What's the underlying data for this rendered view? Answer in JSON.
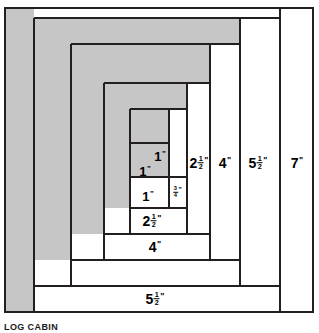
{
  "figure": {
    "caption": "LOG CABIN",
    "colors": {
      "fabric_dark": "#c6c6c6",
      "fabric_light": "#ffffff",
      "line": "#231f20",
      "background": "#ffffff"
    }
  },
  "strips": [
    {
      "id": "center-square",
      "label_whole": "1",
      "label_frac_num": "",
      "label_frac_den": "",
      "unit": "\"",
      "fabric": "dark",
      "x": 130,
      "y": 143,
      "w": 39,
      "h": 34,
      "label_x": 158,
      "label_y": 156,
      "size": "sz-md"
    },
    {
      "id": "log-1-left",
      "label_whole": "1",
      "label_frac_num": "",
      "label_frac_den": "",
      "unit": "\"",
      "fabric": "dark",
      "x": 130,
      "y": 143,
      "w": 39,
      "h": 34,
      "label_x": 145,
      "label_y": 170,
      "size": "sz-md"
    },
    {
      "id": "log-2-bottom",
      "label_whole": "1",
      "label_frac_num": "",
      "label_frac_den": "",
      "unit": "\"",
      "fabric": "light",
      "x": 130,
      "y": 177,
      "w": 39,
      "h": 31,
      "label_x": 148,
      "label_y": 196,
      "size": "sz-md"
    },
    {
      "id": "log-3-right",
      "label_whole": "",
      "label_frac_num": "3",
      "label_frac_den": "4",
      "unit": "\"",
      "fabric": "light",
      "x": 169,
      "y": 109,
      "w": 18,
      "h": 99,
      "label_x": 174,
      "label_y": 192,
      "size": "sz-sm"
    },
    {
      "id": "log-4-top",
      "label_whole": "",
      "label_frac_num": "",
      "label_frac_den": "",
      "unit": "",
      "fabric": "dark",
      "x": 130,
      "y": 109,
      "w": 39,
      "h": 34,
      "label_x": 0,
      "label_y": 0,
      "size": "sz-sm"
    },
    {
      "id": "log-5-left",
      "label_whole": "",
      "label_frac_num": "",
      "label_frac_den": "",
      "unit": "",
      "fabric": "dark",
      "x": 104,
      "y": 109,
      "w": 26,
      "h": 99,
      "label_x": 0,
      "label_y": 0,
      "size": "sz-sm"
    },
    {
      "id": "log-6-top",
      "label_whole": "",
      "label_frac_num": "",
      "label_frac_den": "",
      "unit": "",
      "fabric": "dark",
      "x": 104,
      "y": 83,
      "w": 106,
      "h": 26,
      "label_x": 0,
      "label_y": 0,
      "size": "sz-sm"
    },
    {
      "id": "log-7-right",
      "label_whole": "2",
      "label_frac_num": "1",
      "label_frac_den": "2",
      "unit": "\"",
      "fabric": "light",
      "x": 187,
      "y": 83,
      "w": 23,
      "h": 135,
      "label_x": 199,
      "label_y": 163,
      "size": "sz-lg"
    },
    {
      "id": "log-8-bottom",
      "label_whole": "2",
      "label_frac_num": "1",
      "label_frac_den": "2",
      "unit": "\"",
      "fabric": "light",
      "x": 104,
      "y": 208,
      "w": 106,
      "h": 26,
      "label_x": 152,
      "label_y": 221,
      "size": "sz-lg"
    },
    {
      "id": "log-9-left",
      "label_whole": "",
      "label_frac_num": "",
      "label_frac_den": "",
      "unit": "",
      "fabric": "dark",
      "x": 71,
      "y": 57,
      "w": 33,
      "h": 177,
      "label_x": 0,
      "label_y": 0,
      "size": "sz-sm"
    },
    {
      "id": "log-10-top",
      "label_whole": "",
      "label_frac_num": "",
      "label_frac_den": "",
      "unit": "",
      "fabric": "dark",
      "x": 71,
      "y": 44,
      "w": 169,
      "h": 39,
      "label_x": 0,
      "label_y": 0,
      "size": "sz-sm"
    },
    {
      "id": "log-11-right",
      "label_whole": "4",
      "label_frac_num": "",
      "label_frac_den": "",
      "unit": "\"",
      "fabric": "light",
      "x": 210,
      "y": 44,
      "w": 30,
      "h": 216,
      "label_x": 225,
      "label_y": 163,
      "size": "sz-lg"
    },
    {
      "id": "log-12-bottom",
      "label_whole": "4",
      "label_frac_num": "",
      "label_frac_den": "",
      "unit": "\"",
      "fabric": "light",
      "x": 71,
      "y": 234,
      "w": 169,
      "h": 26,
      "label_x": 155,
      "label_y": 247,
      "size": "sz-lg"
    },
    {
      "id": "log-13-left",
      "label_whole": "",
      "label_frac_num": "",
      "label_frac_den": "",
      "unit": "",
      "fabric": "dark",
      "x": 34,
      "y": 18,
      "w": 37,
      "h": 242,
      "label_x": 0,
      "label_y": 0,
      "size": "sz-sm"
    },
    {
      "id": "log-14-top",
      "label_whole": "",
      "label_frac_num": "",
      "label_frac_den": "",
      "unit": "",
      "fabric": "dark",
      "x": 34,
      "y": 18,
      "w": 240,
      "h": 26,
      "label_x": 0,
      "label_y": 0,
      "size": "sz-sm"
    },
    {
      "id": "log-15-right",
      "label_whole": "5",
      "label_frac_num": "1",
      "label_frac_den": "2",
      "unit": "\"",
      "fabric": "light",
      "x": 240,
      "y": 18,
      "w": 34,
      "h": 268,
      "label_x": 257,
      "label_y": 163,
      "size": "sz-lg"
    },
    {
      "id": "log-16-bottom",
      "label_whole": "5",
      "label_frac_num": "1",
      "label_frac_den": "2",
      "unit": "\"",
      "fabric": "light",
      "x": 34,
      "y": 286,
      "w": 240,
      "h": 26,
      "label_x": 155,
      "label_y": 299,
      "size": "sz-lg"
    },
    {
      "id": "log-17-left",
      "label_whole": "",
      "label_frac_num": "",
      "label_frac_den": "",
      "unit": "",
      "fabric": "dark",
      "x": 5,
      "y": 8,
      "w": 29,
      "h": 304,
      "label_x": 0,
      "label_y": 0,
      "size": "sz-sm"
    },
    {
      "id": "log-18-right",
      "label_whole": "7",
      "label_frac_num": "",
      "label_frac_den": "",
      "unit": "\"",
      "fabric": "light",
      "x": 280,
      "y": 8,
      "w": 33,
      "h": 304,
      "label_x": 297,
      "label_y": 163,
      "size": "sz-lg"
    }
  ]
}
